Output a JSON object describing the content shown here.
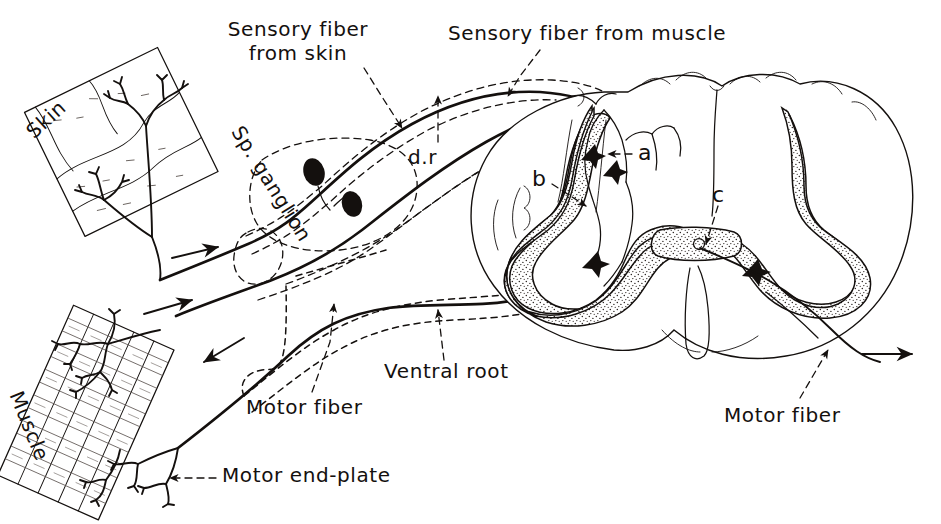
{
  "figure": {
    "type": "anatomical-line-drawing",
    "background_color": "#ffffff",
    "ink_color": "#14100e"
  },
  "labels": {
    "skin": "Skin",
    "muscle": "Muscle",
    "sensory_fiber_from_skin": "Sensory fiber\nfrom skin",
    "sensory_fiber_from_muscle": "Sensory fiber from muscle",
    "sp_ganglion": "Sp. ganglion",
    "dorsal_root": "d.r",
    "ventral_root": "Ventral root",
    "motor_fiber_left": "Motor fiber",
    "motor_fiber_right": "Motor fiber",
    "motor_end_plate": "Motor end-plate",
    "marker_a": "a",
    "marker_b": "b",
    "marker_c": "c"
  },
  "structures": [
    {
      "name": "skin-patch",
      "label": "Skin",
      "description": "rotated stippled rectangle of skin with branching free nerve endings"
    },
    {
      "name": "muscle-band",
      "label": "Muscle",
      "description": "rotated striated muscle band with motor end plates and sensory endings"
    },
    {
      "name": "spinal-ganglion",
      "label": "Sp. ganglion",
      "description": "dorsal root ganglion containing two pseudounipolar cell bodies"
    },
    {
      "name": "spinal-cord",
      "label": "",
      "description": "transverse section of spinal cord, butterfly shaped gray matter with dorsal and ventral horns, central canal"
    },
    {
      "name": "dorsal-root",
      "label": "d.r",
      "description": "dorsal sensory root entering cord"
    },
    {
      "name": "ventral-root",
      "label": "Ventral root",
      "description": "ventral motor root leaving cord"
    },
    {
      "name": "motor-end-plate",
      "label": "Motor end-plate",
      "description": "terminal arborization of motor fiber on muscle"
    }
  ],
  "markers": [
    {
      "id": "a",
      "meaning": "interneuron / dorsal horn connection"
    },
    {
      "id": "b",
      "meaning": "dorsal horn gray matter"
    },
    {
      "id": "c",
      "meaning": "crossed fiber near central canal"
    }
  ],
  "arrows": [
    {
      "name": "arrow-skin-afferent",
      "direction": "right",
      "meaning": "sensory impulse travelling from skin toward cord"
    },
    {
      "name": "arrow-muscle-afferent",
      "direction": "right",
      "meaning": "sensory impulse travelling from muscle toward cord"
    },
    {
      "name": "arrow-motor-efferent-left",
      "direction": "left-down",
      "meaning": "motor impulse travelling from cord to muscle"
    },
    {
      "name": "arrow-motor-efferent-right",
      "direction": "right",
      "meaning": "motor impulse leaving cord on right side"
    }
  ]
}
